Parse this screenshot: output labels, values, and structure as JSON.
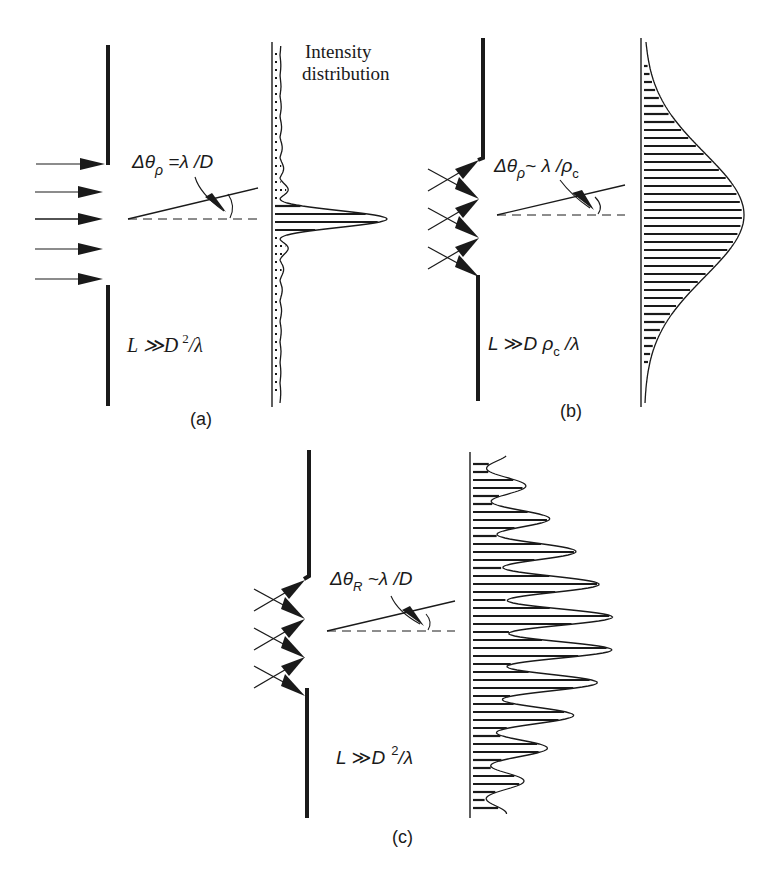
{
  "figure": {
    "ink_color": "#1a1a1a",
    "background": "#ffffff",
    "header_label": {
      "line1": "Intensity",
      "line2": "distribution"
    },
    "panels": [
      {
        "id": "a",
        "caption": "(a)",
        "source_type": "plane-wave",
        "angle_formula": {
          "delta": "Δθ",
          "subscript": "ρ",
          "relation": " =λ /D"
        },
        "condition_formula": {
          "left": "L ≫D",
          "sup": "2",
          "right": "/λ"
        },
        "curve_type": "sinc-squared (narrow central peak with side lobes)"
      },
      {
        "id": "b",
        "caption": "(b)",
        "source_type": "partially-coherent emitters (3)",
        "angle_formula": {
          "delta": "Δθ",
          "subscript": "ρ",
          "relation": "~ λ /ρ",
          "tail_sub": "c"
        },
        "condition_formula": {
          "left": "L ≫D ρ",
          "sub": "c",
          "right": " /λ"
        },
        "curve_type": "gaussian (broad)"
      },
      {
        "id": "c",
        "caption": "(c)",
        "source_type": "partially-coherent emitters (3)",
        "angle_formula": {
          "delta": "Δθ",
          "subscript": "R",
          "relation": " ~λ  /D"
        },
        "condition_formula": {
          "left": "L ≫D",
          "sup": "2",
          "right": "/λ"
        },
        "curve_type": "speckled gaussian envelope"
      }
    ]
  }
}
